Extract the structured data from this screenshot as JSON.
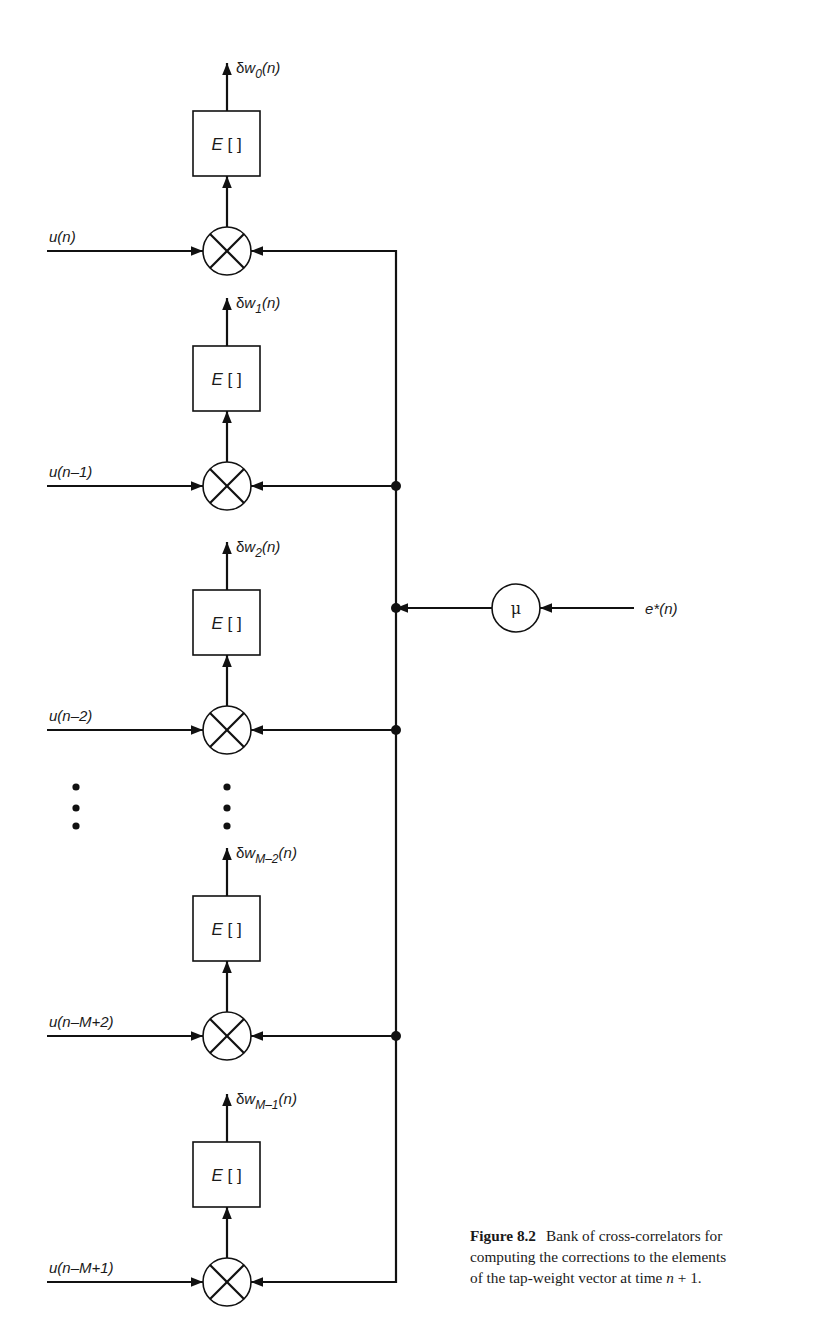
{
  "figure": {
    "type": "block-diagram",
    "title": "Bank of cross-correlators",
    "bus_x": 396,
    "bus_top_y": 251,
    "bus_bottom_y": 1282,
    "input_line_start_x": 47,
    "multiplier_cx": 227,
    "multiplier_r": 24,
    "box": {
      "x": 193,
      "width": 67,
      "height": 65,
      "label": "E [ ]"
    },
    "rows": [
      {
        "id": "0",
        "mult_y": 251,
        "input_label": "u(n)",
        "output_base": "δw",
        "output_sub": "0",
        "output_tail": "(n)",
        "junction_dot": false
      },
      {
        "id": "1",
        "mult_y": 486,
        "input_label": "u(n–1)",
        "output_base": "δw",
        "output_sub": "1",
        "output_tail": "(n)",
        "junction_dot": true
      },
      {
        "id": "2",
        "mult_y": 730,
        "input_label": "u(n–2)",
        "output_base": "δw",
        "output_sub": "2",
        "output_tail": "(n)",
        "junction_dot": true
      },
      {
        "id": "M-2",
        "mult_y": 1036,
        "input_label": "u(n–M+2)",
        "output_base": "δw",
        "output_sub": "M–2",
        "output_tail": "(n)",
        "junction_dot": true
      },
      {
        "id": "M-1",
        "mult_y": 1282,
        "input_label": "u(n–M+1)",
        "output_base": "δw",
        "output_sub": "M–1",
        "output_tail": "(n)",
        "junction_dot": false
      }
    ],
    "ellipsis": {
      "xs": [
        76,
        227
      ],
      "ys": [
        787,
        808,
        826
      ]
    },
    "step_size": {
      "symbol": "μ",
      "cx": 516,
      "cy": 608,
      "r": 24,
      "input_label": "e*(n)",
      "input_line_end_x": 634
    }
  },
  "caption": {
    "figure_number": "Figure 8.2",
    "line1": "Bank of cross-correlators for",
    "line2": "computing the corrections to the elements",
    "line3_pre": "of the tap-weight vector at time ",
    "line3_var": "n",
    "line3_post": " + 1."
  }
}
